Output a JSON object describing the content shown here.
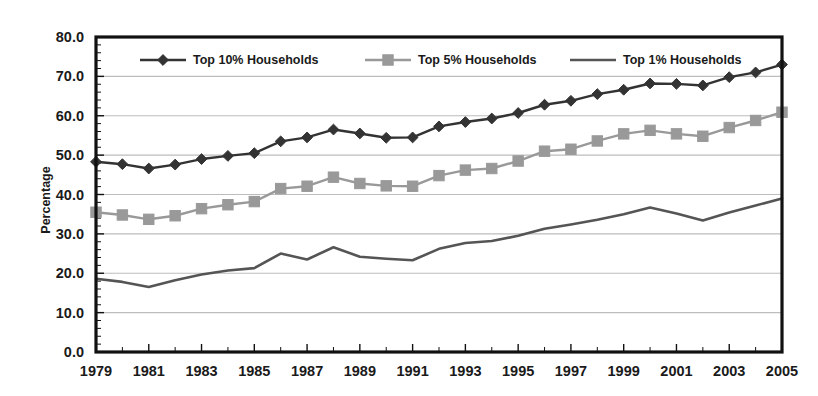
{
  "chart_data": {
    "type": "line",
    "title": "",
    "subtitle": "",
    "xlabel": "",
    "ylabel": "Percentage",
    "xlim": [
      1979,
      2005
    ],
    "ylim": [
      0.0,
      80.0
    ],
    "y_ticks": [
      "0.0",
      "10.0",
      "20.0",
      "30.0",
      "40.0",
      "50.0",
      "60.0",
      "70.0",
      "80.0"
    ],
    "y_tick_values": [
      0,
      10,
      20,
      30,
      40,
      50,
      60,
      70,
      80
    ],
    "x_ticks": [
      "1979",
      "1981",
      "1983",
      "1985",
      "1987",
      "1989",
      "1991",
      "1993",
      "1995",
      "1997",
      "1999",
      "2001",
      "2003",
      "2005"
    ],
    "x_tick_values": [
      1979,
      1981,
      1983,
      1985,
      1987,
      1989,
      1991,
      1993,
      1995,
      1997,
      1999,
      2001,
      2003,
      2005
    ],
    "grid": "horizontal",
    "legend_position": "top-inside",
    "x": [
      1979,
      1980,
      1981,
      1982,
      1983,
      1984,
      1985,
      1986,
      1987,
      1988,
      1989,
      1990,
      1991,
      1992,
      1993,
      1994,
      1995,
      1996,
      1997,
      1998,
      1999,
      2000,
      2001,
      2002,
      2003,
      2004,
      2005
    ],
    "series": [
      {
        "name": "Top 10% Households",
        "marker": "diamond",
        "color": "#333333",
        "values": [
          48.3,
          47.7,
          46.6,
          47.6,
          49.0,
          49.8,
          50.5,
          53.5,
          54.5,
          56.5,
          55.5,
          54.4,
          54.5,
          57.3,
          58.4,
          59.3,
          60.7,
          62.8,
          63.8,
          65.5,
          66.6,
          68.2,
          68.1,
          67.7,
          69.8,
          71.0,
          73.0
        ]
      },
      {
        "name": "Top 5% Households",
        "marker": "square",
        "color": "#999999",
        "values": [
          35.5,
          34.8,
          33.7,
          34.6,
          36.4,
          37.4,
          38.2,
          41.5,
          42.1,
          44.4,
          42.8,
          42.2,
          42.1,
          44.8,
          46.2,
          46.6,
          48.5,
          51.0,
          51.5,
          53.6,
          55.4,
          56.3,
          55.4,
          54.8,
          57.0,
          58.8,
          60.9
        ]
      },
      {
        "name": "Top 1% Households",
        "marker": "none",
        "color": "#555555",
        "values": [
          18.6,
          17.8,
          16.5,
          18.2,
          19.7,
          20.7,
          21.3,
          25.0,
          23.5,
          26.6,
          24.2,
          23.7,
          23.3,
          26.2,
          27.7,
          28.2,
          29.5,
          31.3,
          32.4,
          33.6,
          35.0,
          36.7,
          35.2,
          33.4,
          35.4,
          37.2,
          39.0
        ]
      }
    ],
    "colors": {
      "axis": "#111111",
      "gridline": "#bdbdbd",
      "plot_background": "#ffffff",
      "series_top10": "#333333",
      "series_top5": "#999999",
      "series_top1": "#555555"
    }
  }
}
